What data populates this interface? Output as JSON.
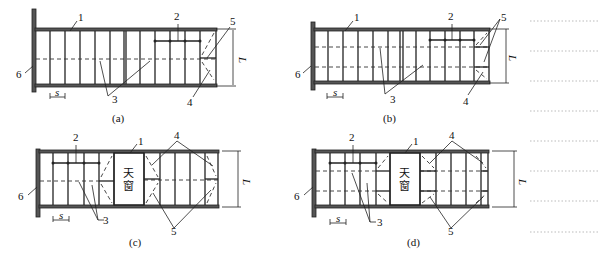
{
  "figure": {
    "panels": [
      {
        "id": "a",
        "caption": "(a)",
        "labels": {
          "chord": "1",
          "tie": "2",
          "purlin": "3",
          "brace_lower": "4",
          "brace_upper": "5",
          "end": "6",
          "spacing": "s",
          "span": "L"
        }
      },
      {
        "id": "b",
        "caption": "(b)",
        "labels": {
          "chord": "1",
          "tie": "2",
          "purlin": "3",
          "brace_lower": "4",
          "brace_upper": "5",
          "end": "6",
          "spacing": "s",
          "span": "L"
        }
      },
      {
        "id": "c",
        "caption": "(c)",
        "skylight_line1": "天",
        "skylight_line2": "窗",
        "labels": {
          "chord": "1",
          "tie": "2",
          "purlin": "3",
          "brace_top": "4",
          "brace_bottom": "5",
          "end": "6",
          "spacing": "s",
          "span": "L"
        }
      },
      {
        "id": "d",
        "caption": "(d)",
        "skylight_line1": "天",
        "skylight_line2": "窗",
        "labels": {
          "chord": "1",
          "tie": "2",
          "purlin": "3",
          "brace_top": "4",
          "brace_bottom": "5",
          "end": "6",
          "spacing": "s",
          "span": "L"
        }
      }
    ]
  }
}
